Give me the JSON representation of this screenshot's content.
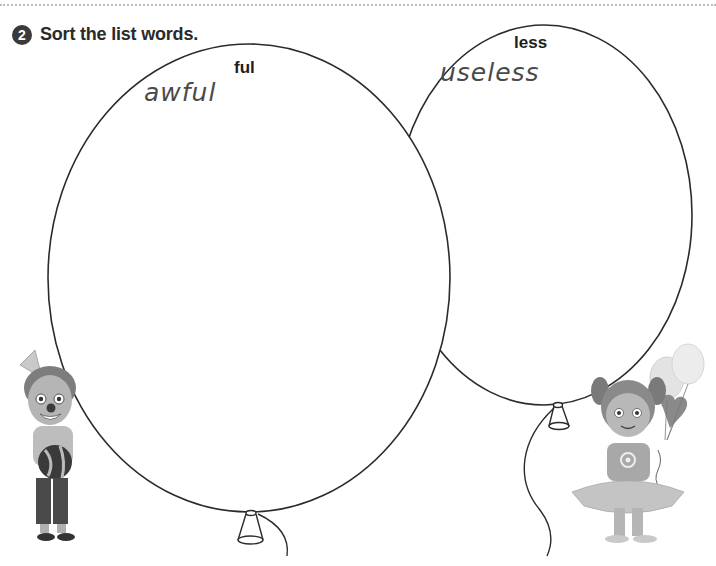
{
  "exercise": {
    "number": "2",
    "instruction": "Sort the list words."
  },
  "balloons": [
    {
      "id": "ful",
      "suffix_label": "ful",
      "words": [
        "awful"
      ],
      "outline_color": "#2b2b2b"
    },
    {
      "id": "less",
      "suffix_label": "less",
      "words": [
        "useless"
      ],
      "outline_color": "#2b2b2b"
    }
  ],
  "illustrations": {
    "left": "clown-boy-with-ball",
    "right": "girl-with-balloons"
  },
  "colors": {
    "badge": "#3a3a3a",
    "rule": "#bdbdbd",
    "handwriting": "#4a4a4a"
  }
}
